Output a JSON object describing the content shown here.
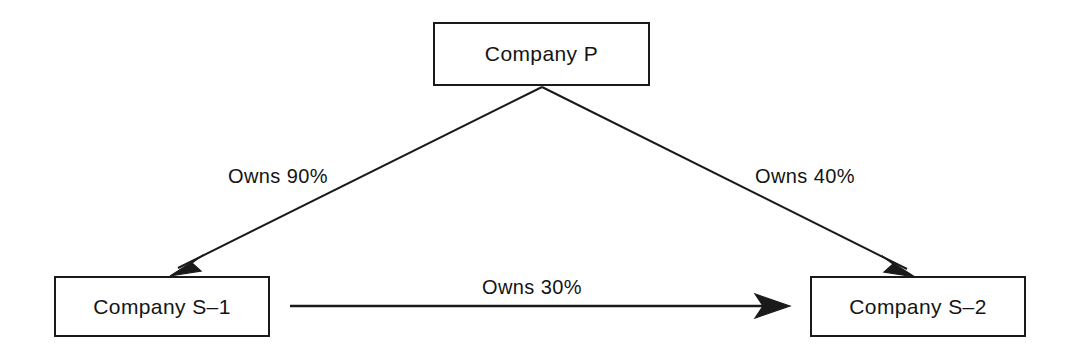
{
  "diagram": {
    "background_color": "#ffffff",
    "line_color": "#1a1a1a",
    "text_color": "#141414",
    "nodes": [
      {
        "id": "company_p",
        "label": "Company P",
        "shape": "rectangle"
      },
      {
        "id": "company_s1",
        "label": "Company S–1",
        "shape": "rectangle"
      },
      {
        "id": "company_s2",
        "label": "Company S–2",
        "shape": "rectangle"
      }
    ],
    "edges": [
      {
        "id": "p_to_s1",
        "from": "company_p",
        "to": "company_s1",
        "label": "Owns 90%",
        "arrow": "single",
        "direction": "down-left"
      },
      {
        "id": "p_to_s2",
        "from": "company_p",
        "to": "company_s2",
        "label": "Owns 40%",
        "arrow": "single",
        "direction": "down-right"
      },
      {
        "id": "s1_to_s2",
        "from": "company_s1",
        "to": "company_s2",
        "label": "Owns 30%",
        "arrow": "single",
        "direction": "right"
      }
    ]
  }
}
